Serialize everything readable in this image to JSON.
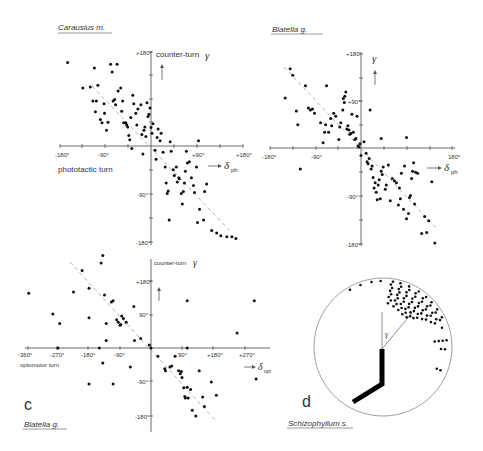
{
  "figure": {
    "panels": [
      {
        "id": "a",
        "title": "Carausius m.",
        "y_axis_label": "counter-turn",
        "y_symbol": "γ",
        "x_axis_label": "phototactic turn",
        "x_symbol": "δ",
        "x_subscript": "ph",
        "x_ticks": [
          "-180°",
          "-90°",
          "+90°",
          "+180°"
        ],
        "y_ticks": [
          "+180°",
          "-90°",
          "-180°"
        ]
      },
      {
        "id": "b",
        "title": "Blatella g.",
        "y_symbol": "γ",
        "x_symbol": "δ",
        "x_subscript": "ph",
        "x_ticks": [
          "-180°",
          "-90°",
          "180°"
        ],
        "y_ticks": [
          "+180°",
          "+90°",
          "-90°",
          "-180°"
        ]
      },
      {
        "id": "c",
        "letter": "c",
        "title": "Blatella g.",
        "y_axis_label": "counter-turn",
        "y_symbol": "γ",
        "x_axis_label": "optomotor turn",
        "x_symbol": "δ",
        "x_subscript": "opt",
        "x_ticks": [
          "-360°",
          "-270°",
          "-180°",
          "-90°",
          "90°",
          "+180°",
          "+270°"
        ],
        "y_ticks": [
          "+180°",
          "90°",
          "-90°",
          "-180°"
        ]
      },
      {
        "id": "d",
        "letter": "d",
        "title": "Schizophyllum s.",
        "angle_symbol": "γ"
      }
    ]
  },
  "chart_data": [
    {
      "type": "scatter",
      "panel": "a",
      "title": "Carausius m.",
      "xlabel": "phototactic turn δph",
      "ylabel": "counter-turn γ",
      "xlim": [
        -180,
        180
      ],
      "ylim": [
        -180,
        180
      ],
      "regression_line": {
        "style": "dashed",
        "from": [
          -120,
          110
        ],
        "to": [
          180,
          -180
        ]
      },
      "points": [
        [
          -165,
          158
        ],
        [
          -135,
          110
        ],
        [
          -120,
          112
        ],
        [
          -112,
          148
        ],
        [
          -105,
          115
        ],
        [
          -115,
          85
        ],
        [
          -108,
          85
        ],
        [
          -110,
          65
        ],
        [
          -100,
          50
        ],
        [
          -97,
          44
        ],
        [
          -93,
          80
        ],
        [
          -92,
          62
        ],
        [
          -88,
          30
        ],
        [
          -85,
          45
        ],
        [
          -80,
          155
        ],
        [
          -77,
          140
        ],
        [
          -75,
          85
        ],
        [
          -72,
          88
        ],
        [
          -70,
          78
        ],
        [
          -67,
          155
        ],
        [
          -65,
          104
        ],
        [
          -60,
          110
        ],
        [
          -58,
          66
        ],
        [
          -56,
          85
        ],
        [
          -54,
          44
        ],
        [
          -50,
          44
        ],
        [
          -48,
          40
        ],
        [
          -46,
          36
        ],
        [
          -44,
          20
        ],
        [
          -42,
          12
        ],
        [
          -40,
          54
        ],
        [
          -38,
          -5
        ],
        [
          -36,
          96
        ],
        [
          -34,
          80
        ],
        [
          -30,
          62
        ],
        [
          -28,
          40
        ],
        [
          -26,
          70
        ],
        [
          -20,
          78
        ],
        [
          -18,
          22
        ],
        [
          -16,
          -15
        ],
        [
          -14,
          30
        ],
        [
          -12,
          36
        ],
        [
          -10,
          18
        ],
        [
          -8,
          82
        ],
        [
          -6,
          56
        ],
        [
          -4,
          60
        ],
        [
          -2,
          72
        ],
        [
          0,
          35
        ],
        [
          2,
          24
        ],
        [
          4,
          42
        ],
        [
          8,
          -8
        ],
        [
          10,
          -25
        ],
        [
          12,
          16
        ],
        [
          14,
          32
        ],
        [
          18,
          10
        ],
        [
          20,
          24
        ],
        [
          24,
          -12
        ],
        [
          28,
          -40
        ],
        [
          30,
          -70
        ],
        [
          32,
          -90
        ],
        [
          34,
          -85
        ],
        [
          36,
          -140
        ],
        [
          38,
          8
        ],
        [
          40,
          -10
        ],
        [
          44,
          -45
        ],
        [
          46,
          -56
        ],
        [
          50,
          -40
        ],
        [
          52,
          -68
        ],
        [
          55,
          -60
        ],
        [
          56,
          -62
        ],
        [
          60,
          -90
        ],
        [
          62,
          -110
        ],
        [
          64,
          -86
        ],
        [
          66,
          -70
        ],
        [
          68,
          -48
        ],
        [
          70,
          -10
        ],
        [
          72,
          -32
        ],
        [
          76,
          -30
        ],
        [
          80,
          -60
        ],
        [
          84,
          -75
        ],
        [
          86,
          -88
        ],
        [
          90,
          -40
        ],
        [
          92,
          -145
        ],
        [
          94,
          10
        ],
        [
          96,
          -120
        ],
        [
          104,
          -140
        ],
        [
          106,
          -86
        ],
        [
          110,
          -72
        ],
        [
          120,
          -160
        ],
        [
          130,
          -165
        ],
        [
          138,
          -170
        ],
        [
          150,
          -172
        ],
        [
          160,
          -172
        ],
        [
          168,
          -175
        ]
      ]
    },
    {
      "type": "scatter",
      "panel": "b",
      "title": "Blatella g.",
      "xlabel": "δph",
      "ylabel": "γ",
      "xlim": [
        -180,
        180
      ],
      "ylim": [
        -180,
        180
      ],
      "regression_line": {
        "style": "dashed",
        "from": [
          -150,
          160
        ],
        "to": [
          160,
          -160
        ]
      },
      "points": [
        [
          -150,
          95
        ],
        [
          -140,
          150
        ],
        [
          -135,
          138
        ],
        [
          -128,
          70
        ],
        [
          -125,
          44
        ],
        [
          -110,
          118
        ],
        [
          -104,
          76
        ],
        [
          -100,
          72
        ],
        [
          -96,
          74
        ],
        [
          -92,
          66
        ],
        [
          -80,
          48
        ],
        [
          -75,
          10
        ],
        [
          -72,
          30
        ],
        [
          -70,
          44
        ],
        [
          -68,
          118
        ],
        [
          -64,
          30
        ],
        [
          -60,
          56
        ],
        [
          -58,
          42
        ],
        [
          -54,
          66
        ],
        [
          -50,
          60
        ],
        [
          -44,
          16
        ],
        [
          -42,
          40
        ],
        [
          -40,
          48
        ],
        [
          -36,
          72
        ],
        [
          -35,
          94
        ],
        [
          -33,
          86
        ],
        [
          -32,
          98
        ],
        [
          -30,
          106
        ],
        [
          -28,
          36
        ],
        [
          -26,
          42
        ],
        [
          -24,
          34
        ],
        [
          -22,
          26
        ],
        [
          -20,
          28
        ],
        [
          -18,
          64
        ],
        [
          -15,
          30
        ],
        [
          -12,
          16
        ],
        [
          -10,
          18
        ],
        [
          -8,
          60
        ],
        [
          -6,
          4
        ],
        [
          -4,
          2
        ],
        [
          -2,
          8
        ],
        [
          0,
          -14
        ],
        [
          6,
          12
        ],
        [
          10,
          -10
        ],
        [
          12,
          -26
        ],
        [
          14,
          -30
        ],
        [
          16,
          -20
        ],
        [
          18,
          72
        ],
        [
          20,
          -40
        ],
        [
          22,
          -34
        ],
        [
          24,
          -56
        ],
        [
          26,
          -76
        ],
        [
          28,
          -66
        ],
        [
          30,
          -84
        ],
        [
          32,
          -98
        ],
        [
          34,
          -70
        ],
        [
          36,
          -60
        ],
        [
          38,
          -96
        ],
        [
          40,
          -44
        ],
        [
          42,
          -50
        ],
        [
          44,
          -36
        ],
        [
          48,
          -78
        ],
        [
          50,
          -70
        ],
        [
          54,
          -32
        ],
        [
          58,
          -100
        ],
        [
          62,
          -58
        ],
        [
          66,
          -62
        ],
        [
          70,
          -66
        ],
        [
          74,
          -108
        ],
        [
          76,
          -76
        ],
        [
          78,
          -96
        ],
        [
          80,
          -48
        ],
        [
          84,
          -116
        ],
        [
          86,
          -34
        ],
        [
          90,
          -134
        ],
        [
          94,
          -124
        ],
        [
          96,
          -94
        ],
        [
          98,
          -90
        ],
        [
          100,
          -58
        ],
        [
          102,
          -44
        ],
        [
          104,
          -28
        ],
        [
          106,
          -106
        ],
        [
          108,
          -46
        ],
        [
          112,
          -48
        ],
        [
          120,
          -162
        ],
        [
          126,
          -130
        ],
        [
          130,
          -160
        ],
        [
          134,
          -138
        ],
        [
          140,
          -64
        ],
        [
          146,
          -180
        ],
        [
          40,
          18
        ],
        [
          90,
          20
        ],
        [
          -120,
          -40
        ]
      ]
    },
    {
      "type": "scatter",
      "panel": "c",
      "title": "Blatella g.",
      "xlabel": "optomotor turn δopt",
      "ylabel": "counter-turn γ",
      "xlim": [
        -360,
        360
      ],
      "ylim": [
        -200,
        240
      ],
      "regression_line": {
        "style": "dashed",
        "from": [
          -230,
          240
        ],
        "to": [
          170,
          -190
        ]
      },
      "points": [
        [
          -355,
          145
        ],
        [
          -285,
          90
        ],
        [
          -265,
          65
        ],
        [
          -225,
          148
        ],
        [
          -200,
          205
        ],
        [
          -180,
          158
        ],
        [
          -180,
          80
        ],
        [
          -145,
          225
        ],
        [
          -140,
          245
        ],
        [
          -135,
          140
        ],
        [
          -130,
          65
        ],
        [
          -130,
          20
        ],
        [
          -115,
          122
        ],
        [
          -110,
          125
        ],
        [
          -100,
          75
        ],
        [
          -95,
          68
        ],
        [
          -90,
          60
        ],
        [
          -88,
          62
        ],
        [
          -85,
          85
        ],
        [
          -80,
          78
        ],
        [
          -72,
          68
        ],
        [
          -50,
          110
        ],
        [
          -48,
          20
        ],
        [
          -30,
          25
        ],
        [
          -5,
          8
        ],
        [
          0,
          0
        ],
        [
          20,
          -22
        ],
        [
          40,
          -55
        ],
        [
          42,
          -60
        ],
        [
          55,
          -50
        ],
        [
          60,
          -48
        ],
        [
          70,
          -22
        ],
        [
          80,
          -60
        ],
        [
          85,
          -68
        ],
        [
          88,
          -62
        ],
        [
          90,
          -78
        ],
        [
          95,
          -105
        ],
        [
          98,
          -128
        ],
        [
          100,
          -132
        ],
        [
          105,
          -104
        ],
        [
          108,
          -132
        ],
        [
          115,
          -110
        ],
        [
          120,
          -165
        ],
        [
          130,
          -180
        ],
        [
          140,
          -60
        ],
        [
          150,
          -130
        ],
        [
          155,
          -155
        ],
        [
          175,
          -90
        ],
        [
          190,
          -125
        ],
        [
          105,
          125
        ],
        [
          250,
          40
        ],
        [
          300,
          125
        ],
        [
          305,
          -82
        ],
        [
          -140,
          -40
        ],
        [
          -60,
          -50
        ],
        [
          -180,
          -95
        ],
        [
          -110,
          -95
        ],
        [
          -270,
          0
        ],
        [
          -150,
          0
        ],
        [
          105,
          0
        ]
      ]
    },
    {
      "type": "scatter",
      "panel": "d",
      "title": "Schizophyllum s.",
      "description": "polar plot of counter-turn angle γ; dots along radial rays clustered between 0° and ~120° clockwise from vertical near circle rim",
      "coordinate": "polar",
      "radius": 1
    }
  ]
}
